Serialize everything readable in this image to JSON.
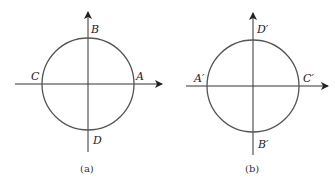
{
  "figures": [
    {
      "id": "a",
      "caption": "(a)",
      "labels": {
        "top": "B",
        "right": "A",
        "left": "C",
        "bottom": "D"
      },
      "geometry": {
        "cx": 88,
        "cy": 84,
        "r": 46
      }
    },
    {
      "id": "b",
      "caption": "(b)",
      "labels": {
        "top": "D′",
        "right": "C′",
        "left": "A′",
        "bottom": "B′"
      },
      "geometry": {
        "cx": 253,
        "cy": 86,
        "r": 46
      }
    }
  ],
  "colors": {
    "circle": "#555555",
    "axis": "#333333",
    "text": "#222222"
  }
}
